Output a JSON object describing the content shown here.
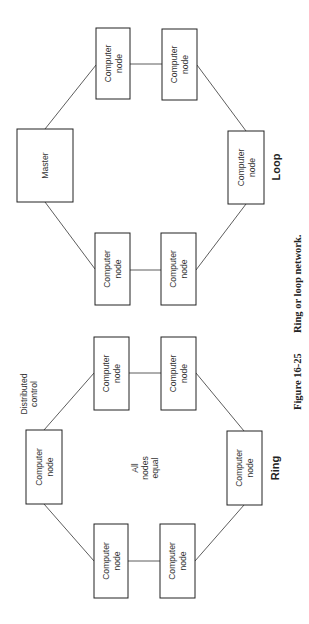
{
  "figure": {
    "caption_number": "Figure 16-25",
    "caption_text": "Ring or loop network."
  },
  "loop": {
    "title": "Loop",
    "master_label": "Master",
    "nodes": [
      {
        "line1": "Computer",
        "line2": "node"
      },
      {
        "line1": "Computer",
        "line2": "node"
      },
      {
        "line1": "Computer",
        "line2": "node"
      },
      {
        "line1": "Computer",
        "line2": "node"
      },
      {
        "line1": "Computer",
        "line2": "node"
      }
    ]
  },
  "ring": {
    "title": "Ring",
    "annotation_line1": "Distributed",
    "annotation_line2": "control",
    "center_line1": "All",
    "center_line2": "nodes",
    "center_line3": "equal",
    "nodes": [
      {
        "line1": "Computer",
        "line2": "node"
      },
      {
        "line1": "Computer",
        "line2": "node"
      },
      {
        "line1": "Computer",
        "line2": "node"
      },
      {
        "line1": "Computer",
        "line2": "node"
      },
      {
        "line1": "Computer",
        "line2": "node"
      },
      {
        "line1": "Computer",
        "line2": "node"
      }
    ]
  }
}
